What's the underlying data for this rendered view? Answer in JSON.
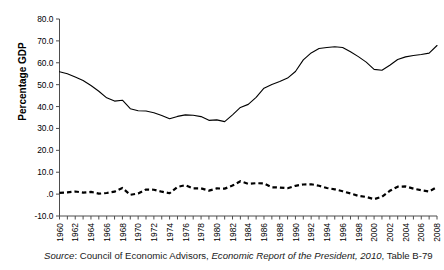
{
  "figure": {
    "y_axis_title": "Percentage GDP",
    "source_prefix": "Source",
    "source_sep": ": ",
    "source_org": "Council of Economic Advisors, ",
    "source_title": "Economic Report of the President, 2010",
    "source_suffix": ", Table B-79"
  },
  "chart_data": {
    "type": "line",
    "title": "",
    "xlabel": "",
    "ylabel": "Percentage GDP",
    "xlim": [
      1960,
      2008
    ],
    "ylim": [
      -10.0,
      80.0
    ],
    "grid": false,
    "legend": "none",
    "ytick_labels": [
      "80.0",
      "70.0",
      "60.0",
      "50.0",
      "40.0",
      "30.0",
      "20.0",
      "10.0",
      ".0",
      "-10.0"
    ],
    "ytick_values": [
      80,
      70,
      60,
      50,
      40,
      30,
      20,
      10,
      0,
      -10
    ],
    "xtick_labels": [
      "1960",
      "1962",
      "1964",
      "1966",
      "1968",
      "1970",
      "1972",
      "1974",
      "1976",
      "1978",
      "1980",
      "1982",
      "1984",
      "1986",
      "1988",
      "1990",
      "1992",
      "1994",
      "1996",
      "1998",
      "2000",
      "2002",
      "2004",
      "2006",
      "2008"
    ],
    "x": [
      1960,
      1961,
      1962,
      1963,
      1964,
      1965,
      1966,
      1967,
      1968,
      1969,
      1970,
      1971,
      1972,
      1973,
      1974,
      1975,
      1976,
      1977,
      1978,
      1979,
      1980,
      1981,
      1982,
      1983,
      1984,
      1985,
      1986,
      1987,
      1988,
      1989,
      1990,
      1991,
      1992,
      1993,
      1994,
      1995,
      1996,
      1997,
      1998,
      1999,
      2000,
      2001,
      2002,
      2003,
      2004,
      2005,
      2006,
      2007,
      2008
    ],
    "series": [
      {
        "name": "Gross federal debt",
        "style": "solid",
        "color": "#000000",
        "values": [
          55.9,
          55.0,
          53.5,
          51.9,
          49.6,
          47.0,
          44.0,
          42.5,
          42.9,
          39.0,
          38.1,
          38.0,
          37.2,
          35.9,
          34.4,
          35.5,
          36.2,
          36.0,
          35.4,
          33.7,
          33.9,
          33.1,
          36.2,
          39.6,
          41.0,
          44.2,
          48.4,
          50.1,
          51.4,
          53.0,
          56.0,
          61.3,
          64.5,
          66.5,
          67.0,
          67.3,
          67.0,
          65.0,
          62.8,
          60.3,
          57.0,
          56.6,
          58.9,
          61.5,
          62.7,
          63.3,
          63.8,
          64.4,
          67.9
        ]
      },
      {
        "name": "Federal deficit",
        "style": "dashed",
        "color": "#000000",
        "values": [
          0.6,
          0.8,
          1.2,
          0.7,
          1.0,
          0.2,
          0.5,
          1.1,
          2.8,
          -0.3,
          0.3,
          2.1,
          2.0,
          1.1,
          0.4,
          3.3,
          4.1,
          2.6,
          2.6,
          1.6,
          2.6,
          2.5,
          3.9,
          5.9,
          4.7,
          5.0,
          4.9,
          3.1,
          3.0,
          2.7,
          3.8,
          4.4,
          4.5,
          3.8,
          2.8,
          2.2,
          1.3,
          0.3,
          -0.8,
          -1.3,
          -2.3,
          -1.2,
          1.5,
          3.4,
          3.5,
          2.5,
          1.8,
          1.2,
          3.2
        ]
      }
    ]
  }
}
